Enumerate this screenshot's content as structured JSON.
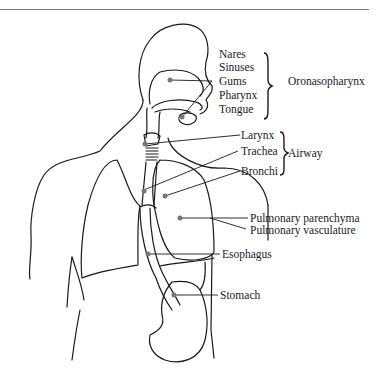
{
  "figure": {
    "groups": [
      {
        "name": "Oronasopharynx",
        "items": [
          "Nares",
          "Sinuses",
          "Gums",
          "Pharynx",
          "Tongue"
        ]
      },
      {
        "name": "Airway",
        "items": [
          "Larynx",
          "Trachea",
          "Bronchi"
        ]
      }
    ],
    "labels": {
      "nares": "Nares",
      "sinuses": "Sinuses",
      "gums": "Gums",
      "pharynx": "Pharynx",
      "tongue": "Tongue",
      "oronasopharynx": "Oronasopharynx",
      "larynx": "Larynx",
      "trachea": "Trachea",
      "bronchi": "Bronchi",
      "airway": "Airway",
      "pulmonary_parenchyma": "Pulmonary parenchyma",
      "pulmonary_vasculature": "Pulmonary vasculature",
      "esophagus": "Esophagus",
      "stomach": "Stomach"
    },
    "colors": {
      "line": "#1a1a1a",
      "marker": "#777777",
      "rule": "#7a7a7a"
    }
  }
}
